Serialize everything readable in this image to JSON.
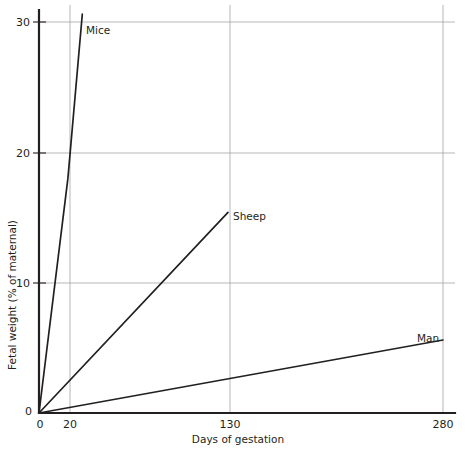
{
  "chart_data": {
    "type": "line",
    "title_visible_fragment": "",
    "xlabel": "Days of gestation",
    "ylabel": "Fetal weight (% of maternal)",
    "xlim": [
      0,
      290
    ],
    "ylim": [
      0,
      31.5
    ],
    "xticks": [
      0,
      20,
      130,
      280
    ],
    "xticklabels": [
      "0",
      "20",
      "130",
      "280"
    ],
    "yticks": [
      0,
      10,
      20,
      30
    ],
    "yticklabels": [
      "0",
      "10",
      "20",
      "30"
    ],
    "grid": true,
    "grid_axes": "both",
    "legend": "inline-labels",
    "legend_position": "at-line-ends",
    "series": [
      {
        "name": "Mice",
        "label": "Mice",
        "color": "#231f20",
        "x": [
          0,
          20,
          30
        ],
        "y": [
          0,
          18.0,
          30.6
        ],
        "label_x": 30,
        "label_y": 30.0
      },
      {
        "name": "Sheep",
        "label": "Sheep",
        "color": "#231f20",
        "x": [
          0,
          131
        ],
        "y": [
          0,
          15.4
        ],
        "label_x": 134,
        "label_y": 15.8
      },
      {
        "name": "Man",
        "label": "Man",
        "color": "#231f20",
        "x": [
          0,
          280
        ],
        "y": [
          0,
          5.6
        ],
        "label_x": 268,
        "label_y": 7.0
      }
    ],
    "annotations": []
  },
  "axes": {
    "x_axis_title": "Days of gestation",
    "y_axis_title": "Fetal weight (% of maternal)",
    "x_tick_0": "0",
    "x_tick_20": "20",
    "x_tick_130": "130",
    "x_tick_280": "280",
    "y_tick_0": "0",
    "y_tick_10": "10",
    "y_tick_20": "20",
    "y_tick_30": "30"
  },
  "series_labels": {
    "mice": "Mice",
    "sheep": "Sheep",
    "man": "Man"
  }
}
